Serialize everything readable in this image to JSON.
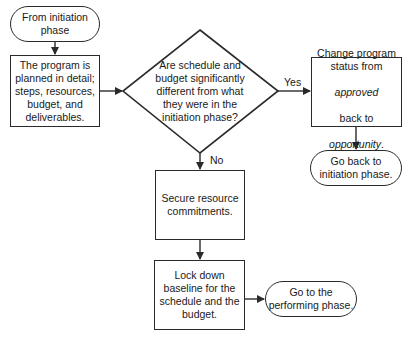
{
  "nodes": {
    "start": {
      "type": "terminal",
      "text": "From initiation\nphase"
    },
    "plan": {
      "type": "process",
      "text": "The program is\nplanned in detail;\nsteps, resources,\nbudget, and\ndeliverables."
    },
    "decision": {
      "type": "decision",
      "text": "Are schedule and\nbudget significantly\ndifferent from what\nthey were in the\ninitiation phase?"
    },
    "change": {
      "type": "process",
      "line1": "Change program\nstatus from",
      "line2": "approved",
      "line3": "back to",
      "line4": "opportunity",
      "line4_suffix": "."
    },
    "goback": {
      "type": "terminal",
      "text": "Go back to\ninitiation phase."
    },
    "secure": {
      "type": "process",
      "text": "Secure resource\ncommitments."
    },
    "lock": {
      "type": "process",
      "text": "Lock down\nbaseline for the\nschedule and the\nbudget."
    },
    "perform": {
      "type": "terminal",
      "text": "Go to the\nperforming phase."
    }
  },
  "edges": {
    "yes_label": "Yes",
    "no_label": "No"
  },
  "colors": {
    "stroke": "#2a2a2a",
    "background": "#ffffff",
    "text": "#1a1a1a"
  }
}
